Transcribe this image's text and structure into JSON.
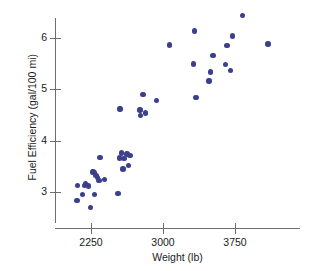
{
  "chart_data": {
    "type": "scatter",
    "title": "",
    "xlabel": "Weight (lb)",
    "ylabel": "Fuel Efficiency (gal/100 mi)",
    "xlim": [
      2000,
      4200
    ],
    "ylim": [
      2.55,
      6.6
    ],
    "xticks": [
      2250,
      3000,
      3750
    ],
    "xtick_labels": [
      "2250",
      "3000",
      "3750"
    ],
    "yticks": [
      3,
      4,
      5,
      6
    ],
    "ytick_labels": [
      "3",
      "4",
      "5",
      "6"
    ],
    "grid": false,
    "legend": null,
    "marker_color": "#3b3f8c",
    "axis_color": "#6d6d72",
    "background_color": "#ffffff",
    "n_points": 42,
    "points": [
      {
        "x": 2105,
        "y": 2.84
      },
      {
        "x": 2110,
        "y": 3.13
      },
      {
        "x": 2160,
        "y": 2.95
      },
      {
        "x": 2185,
        "y": 3.13
      },
      {
        "x": 2195,
        "y": 3.16
      },
      {
        "x": 2225,
        "y": 3.12
      },
      {
        "x": 2245,
        "y": 2.7
      },
      {
        "x": 2270,
        "y": 3.39
      },
      {
        "x": 2280,
        "y": 3.38
      },
      {
        "x": 2285,
        "y": 2.95
      },
      {
        "x": 2300,
        "y": 3.32
      },
      {
        "x": 2320,
        "y": 3.28
      },
      {
        "x": 2335,
        "y": 3.23
      },
      {
        "x": 2345,
        "y": 3.67
      },
      {
        "x": 2530,
        "y": 2.97
      },
      {
        "x": 2545,
        "y": 3.66
      },
      {
        "x": 2550,
        "y": 4.62
      },
      {
        "x": 2565,
        "y": 3.76
      },
      {
        "x": 2585,
        "y": 3.45
      },
      {
        "x": 2595,
        "y": 3.65
      },
      {
        "x": 2625,
        "y": 3.74
      },
      {
        "x": 2640,
        "y": 3.52
      },
      {
        "x": 2655,
        "y": 3.71
      },
      {
        "x": 2760,
        "y": 4.6
      },
      {
        "x": 2765,
        "y": 4.49
      },
      {
        "x": 2790,
        "y": 4.9
      },
      {
        "x": 2820,
        "y": 4.54
      },
      {
        "x": 2930,
        "y": 4.78
      },
      {
        "x": 3070,
        "y": 5.86
      },
      {
        "x": 3320,
        "y": 5.49
      },
      {
        "x": 3330,
        "y": 6.14
      },
      {
        "x": 3345,
        "y": 4.84
      },
      {
        "x": 3480,
        "y": 5.16
      },
      {
        "x": 3495,
        "y": 5.34
      },
      {
        "x": 3520,
        "y": 5.66
      },
      {
        "x": 3650,
        "y": 5.48
      },
      {
        "x": 3665,
        "y": 5.85
      },
      {
        "x": 3700,
        "y": 5.37
      },
      {
        "x": 3725,
        "y": 6.04
      },
      {
        "x": 3830,
        "y": 6.44
      },
      {
        "x": 4095,
        "y": 5.88
      },
      {
        "x": 2390,
        "y": 3.24
      }
    ]
  }
}
